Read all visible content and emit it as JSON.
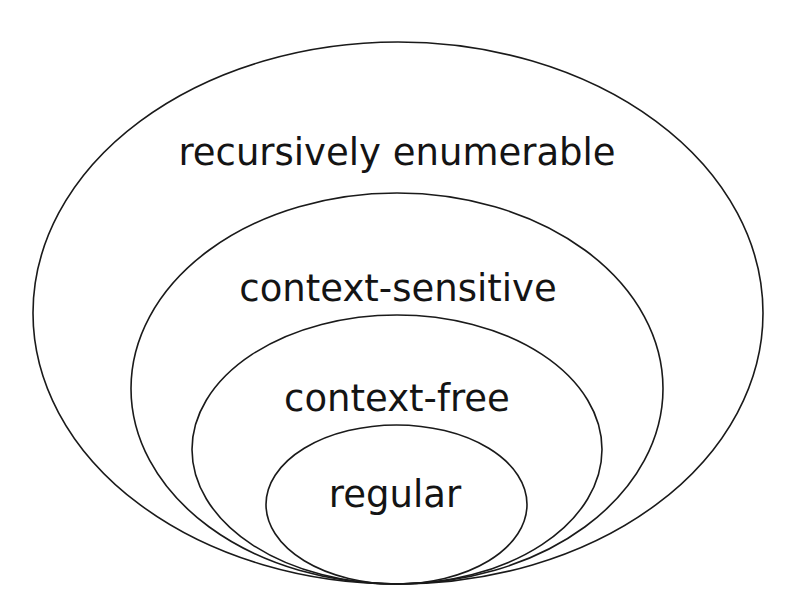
{
  "diagram": {
    "colors": {
      "background": "#ffffff",
      "stroke": "#1a1a1a",
      "text": "#141414"
    },
    "sets": [
      {
        "id": "recursively-enumerable",
        "label": "recursively enumerable",
        "ellipse": {
          "cx": 398,
          "cy": 313,
          "rx": 365,
          "ry": 271
        },
        "label_pos": {
          "x": 397,
          "y": 165
        },
        "font_size": 37
      },
      {
        "id": "context-sensitive",
        "label": "context-sensitive",
        "ellipse": {
          "cx": 397,
          "cy": 388.5,
          "rx": 266,
          "ry": 195.5
        },
        "label_pos": {
          "x": 398,
          "y": 301
        },
        "font_size": 37
      },
      {
        "id": "context-free",
        "label": "context-free",
        "ellipse": {
          "cx": 397,
          "cy": 449.5,
          "rx": 205,
          "ry": 134.5
        },
        "label_pos": {
          "x": 397,
          "y": 411
        },
        "font_size": 37
      },
      {
        "id": "regular",
        "label": "regular",
        "ellipse": {
          "cx": 396.5,
          "cy": 504.5,
          "rx": 130.5,
          "ry": 79.5
        },
        "label_pos": {
          "x": 395,
          "y": 507
        },
        "font_size": 37
      }
    ]
  }
}
